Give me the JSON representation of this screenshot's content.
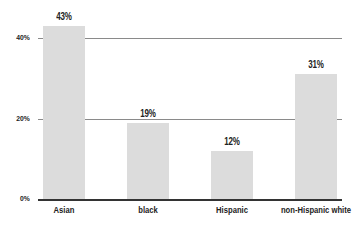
{
  "chart_data": {
    "type": "bar",
    "title": "",
    "xlabel": "",
    "ylabel": "",
    "categories": [
      "Asian",
      "black",
      "Hispanic",
      "non-Hispanic white"
    ],
    "values": [
      43,
      19,
      12,
      31
    ],
    "value_labels": [
      "43%",
      "19%",
      "12%",
      "31%"
    ],
    "y_ticks": [
      "0%",
      "20%",
      "40%"
    ],
    "ylim": [
      0,
      45
    ],
    "grid": true,
    "legend": null,
    "bar_color": "#dcdcdc"
  }
}
